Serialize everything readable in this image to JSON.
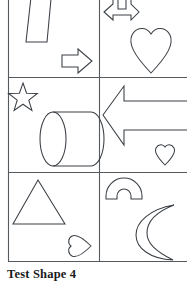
{
  "caption": {
    "text": "Test Shape 4"
  },
  "colors": {
    "background": "#ffffff",
    "grid_stroke": "#555a5e",
    "shape_stroke": "#3a3f44",
    "caption_text": "#1a1a1a"
  },
  "figure": {
    "type": "shape-matrix",
    "rows": 3,
    "columns": 2,
    "grid": {
      "left": 8,
      "top": 0,
      "right": 187,
      "bottom": 262,
      "column_divider_x": 99,
      "row_divider_y": [
        77,
        172
      ]
    },
    "cells": [
      {
        "id": "cell-r1c1",
        "row": 1,
        "column": 1,
        "shapes": [
          {
            "name": "trapezoid",
            "label": "Inverted trapezoid (clipped at top)",
            "position": "top-center"
          },
          {
            "name": "right-arrow",
            "label": "Right-pointing block arrow",
            "position": "bottom-right"
          }
        ]
      },
      {
        "id": "cell-r1c2",
        "row": 1,
        "column": 2,
        "shapes": [
          {
            "name": "double-headed-arrow",
            "label": "Left-right double arrow with upward stems (clipped at top)",
            "position": "top-left"
          },
          {
            "name": "heart",
            "label": "Large heart",
            "position": "center-right"
          }
        ]
      },
      {
        "id": "cell-r2c1",
        "row": 2,
        "column": 1,
        "shapes": [
          {
            "name": "star",
            "label": "Five-pointed star",
            "position": "top-left"
          },
          {
            "name": "cylinder",
            "label": "Horizontal cylinder",
            "position": "center"
          }
        ]
      },
      {
        "id": "cell-r2c2",
        "row": 2,
        "column": 2,
        "shapes": [
          {
            "name": "left-arrow",
            "label": "Large left-pointing block arrow (clipped at right)",
            "position": "top-center"
          },
          {
            "name": "heart-small",
            "label": "Small heart",
            "position": "bottom-right"
          }
        ]
      },
      {
        "id": "cell-r3c1",
        "row": 3,
        "column": 1,
        "shapes": [
          {
            "name": "triangle",
            "label": "Triangle",
            "position": "top-center"
          },
          {
            "name": "heart-rotated",
            "label": "Small heart rotated to point right",
            "position": "bottom-right"
          }
        ]
      },
      {
        "id": "cell-r3c2",
        "row": 3,
        "column": 2,
        "shapes": [
          {
            "name": "arch",
            "label": "Semicircular arch band",
            "position": "top-left"
          },
          {
            "name": "crescent-moon",
            "label": "Crescent moon (clipped at right)",
            "position": "bottom-right"
          }
        ]
      }
    ]
  }
}
